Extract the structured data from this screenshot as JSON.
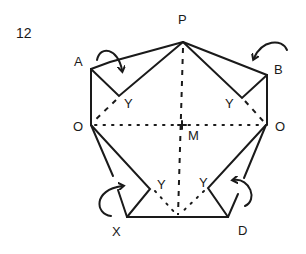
{
  "step_number": "12",
  "labels": {
    "P": "P",
    "A": "A",
    "B": "B",
    "O_left": "O",
    "O_right": "O",
    "M": "M",
    "X": "X",
    "D": "D",
    "Y_upper_left": "Y",
    "Y_upper_right": "Y",
    "Y_lower_left": "Y",
    "Y_lower_right": "Y"
  },
  "colors": {
    "ink": "#1a1a1a",
    "background": "#ffffff"
  }
}
